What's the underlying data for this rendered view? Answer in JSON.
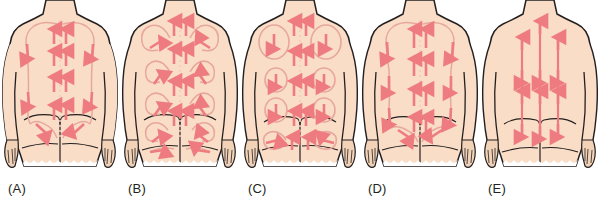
{
  "figure": {
    "background_color": "#ffffff",
    "panel_count": 5,
    "skin_color": "#f9ddc6",
    "skin_shadow_color": "#f0cbb0",
    "outline_color": "#231f20",
    "arrow_color": "#ee7b80",
    "path_color": "#e8a79c",
    "spine_color": "#f3c9c2",
    "label_color": "#231f20"
  },
  "panels": [
    {
      "id": "panel-a",
      "label": "(A)",
      "stroke_pattern": "effleurage",
      "description": "Long gliding strokes upward along the spine and down the lateral sides in a continuous loop",
      "x": 0
    },
    {
      "id": "panel-b",
      "label": "(B)",
      "stroke_pattern": "petrissage-small-circles",
      "description": "Upward strokes beside the spine with small circular kneading loops over the scapulae, flanks, and buttocks",
      "x": 120
    },
    {
      "id": "panel-c",
      "label": "(C)",
      "stroke_pattern": "large-circular-friction",
      "description": "Upward strokes along the spine with large open circular loops turning downward over the back and buttocks",
      "x": 240
    },
    {
      "id": "panel-d",
      "label": "(D)",
      "stroke_pattern": "long-stroke-circuit",
      "description": "Paired upward strokes along the spine returning downward along the lateral trunk and over the buttocks",
      "x": 360
    },
    {
      "id": "panel-e",
      "label": "(E)",
      "stroke_pattern": "vertical-bidirectional",
      "description": "Three straight vertical double-headed strokes running the full length of the back",
      "x": 480
    }
  ]
}
